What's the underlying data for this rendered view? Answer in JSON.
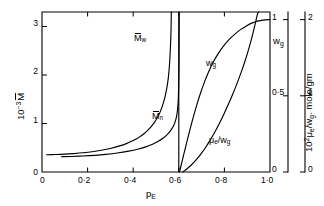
{
  "chart_data": {
    "type": "line",
    "title": "",
    "xlabel": "p_E",
    "xlabel_parts": {
      "base": "p",
      "sub": "E"
    },
    "xlim": [
      0,
      1.0
    ],
    "xticks": [
      0,
      0.2,
      0.4,
      0.6,
      0.8,
      1.0
    ],
    "xticklabels": [
      "0",
      "0·2",
      "0·4",
      "0·6",
      "0·8",
      "1·0"
    ],
    "grid": false,
    "legend": "none (curves labelled inline)",
    "axes": [
      {
        "id": "left",
        "position": "left",
        "label": "10⁻³ M̄",
        "label_parts": {
          "prefix": "10",
          "exponent": "-3",
          "symbol": "M",
          "overline": true
        },
        "lim": [
          0,
          3.3
        ],
        "ticks": [
          0,
          1,
          2,
          3
        ],
        "ticklabels": [
          "0",
          "1",
          "2",
          "3"
        ]
      },
      {
        "id": "right-inner",
        "position": "right-inner",
        "label": "w_g",
        "label_parts": {
          "base": "w",
          "sub": "g"
        },
        "lim": [
          0,
          1.05
        ],
        "ticks": [
          0,
          0.5,
          1
        ],
        "ticklabels": [
          "0",
          "0·5",
          "1"
        ]
      },
      {
        "id": "right-outer",
        "position": "right-outer",
        "label": "10² μ_e/w_g. mole/gm",
        "label_parts": {
          "prefix": "10",
          "exponent": "2",
          "symbol": "μ",
          "sub": "e",
          "divisor": "w",
          "divisor_sub": "g",
          "units": ". mole/gm"
        },
        "lim": [
          0,
          2.1
        ],
        "ticks": [
          0,
          1,
          2
        ],
        "ticklabels": [
          "0",
          "1",
          "2"
        ]
      }
    ],
    "annotations": [
      {
        "name": "gel-point-asymptote",
        "type": "vertical-line",
        "x": 0.6
      }
    ],
    "series": [
      {
        "name": "M̄w",
        "label": "M̄w",
        "label_parts": {
          "symbol": "M",
          "overline": true,
          "sub": "w"
        },
        "axis": "left",
        "color": "#000000",
        "asymptote_x": 0.565,
        "points": [
          [
            0.02,
            0.355
          ],
          [
            0.06,
            0.36
          ],
          [
            0.1,
            0.368
          ],
          [
            0.14,
            0.38
          ],
          [
            0.18,
            0.396
          ],
          [
            0.22,
            0.418
          ],
          [
            0.26,
            0.448
          ],
          [
            0.3,
            0.486
          ],
          [
            0.34,
            0.538
          ],
          [
            0.37,
            0.586
          ],
          [
            0.4,
            0.648
          ],
          [
            0.425,
            0.714
          ],
          [
            0.45,
            0.8
          ],
          [
            0.47,
            0.888
          ],
          [
            0.49,
            1.002
          ],
          [
            0.505,
            1.112
          ],
          [
            0.518,
            1.235
          ],
          [
            0.53,
            1.39
          ],
          [
            0.54,
            1.56
          ],
          [
            0.548,
            1.745
          ],
          [
            0.554,
            1.94
          ],
          [
            0.558,
            2.14
          ],
          [
            0.561,
            2.35
          ],
          [
            0.5635,
            2.59
          ],
          [
            0.5655,
            2.85
          ],
          [
            0.5665,
            3.08
          ],
          [
            0.5672,
            3.3
          ]
        ]
      },
      {
        "name": "M̄n",
        "label": "M̄n",
        "label_parts": {
          "symbol": "M",
          "overline": true,
          "sub": "n"
        },
        "axis": "left",
        "color": "#000000",
        "asymptote_x": 0.6,
        "points": [
          [
            0.085,
            0.315
          ],
          [
            0.13,
            0.32
          ],
          [
            0.18,
            0.33
          ],
          [
            0.23,
            0.344
          ],
          [
            0.28,
            0.364
          ],
          [
            0.33,
            0.392
          ],
          [
            0.38,
            0.43
          ],
          [
            0.42,
            0.47
          ],
          [
            0.455,
            0.518
          ],
          [
            0.485,
            0.572
          ],
          [
            0.51,
            0.632
          ],
          [
            0.532,
            0.7
          ],
          [
            0.55,
            0.775
          ],
          [
            0.564,
            0.855
          ],
          [
            0.576,
            0.945
          ],
          [
            0.584,
            1.035
          ],
          [
            0.59,
            1.14
          ],
          [
            0.5945,
            1.29
          ],
          [
            0.5975,
            1.48
          ],
          [
            0.5992,
            1.72
          ],
          [
            0.6002,
            2.01
          ],
          [
            0.601,
            2.36
          ],
          [
            0.6014,
            2.76
          ],
          [
            0.6017,
            3.3
          ]
        ]
      },
      {
        "name": "wg",
        "label": "wg",
        "label_parts": {
          "base": "w",
          "sub": "g"
        },
        "axis": "right-inner",
        "color": "#000000",
        "points": [
          [
            0.603,
            0.0
          ],
          [
            0.612,
            0.055
          ],
          [
            0.622,
            0.118
          ],
          [
            0.634,
            0.19
          ],
          [
            0.648,
            0.272
          ],
          [
            0.662,
            0.352
          ],
          [
            0.678,
            0.436
          ],
          [
            0.694,
            0.512
          ],
          [
            0.712,
            0.588
          ],
          [
            0.73,
            0.655
          ],
          [
            0.75,
            0.718
          ],
          [
            0.772,
            0.775
          ],
          [
            0.795,
            0.824
          ],
          [
            0.82,
            0.868
          ],
          [
            0.846,
            0.905
          ],
          [
            0.872,
            0.936
          ],
          [
            0.898,
            0.96
          ],
          [
            0.92,
            0.977
          ],
          [
            0.945,
            0.99
          ],
          [
            0.97,
            0.997
          ],
          [
            1.0,
            1.0
          ]
        ]
      },
      {
        "name": "μe/wg",
        "label": "μe/wg",
        "label_parts": {
          "symbol": "μ",
          "sub": "e",
          "divisor": "w",
          "divisor_sub": "g"
        },
        "axis": "right-outer",
        "color": "#000000",
        "points": [
          [
            0.617,
            0.0
          ],
          [
            0.635,
            0.04
          ],
          [
            0.655,
            0.092
          ],
          [
            0.675,
            0.155
          ],
          [
            0.695,
            0.228
          ],
          [
            0.715,
            0.312
          ],
          [
            0.735,
            0.405
          ],
          [
            0.755,
            0.508
          ],
          [
            0.775,
            0.62
          ],
          [
            0.795,
            0.742
          ],
          [
            0.815,
            0.872
          ],
          [
            0.835,
            1.01
          ],
          [
            0.855,
            1.16
          ],
          [
            0.875,
            1.32
          ],
          [
            0.893,
            1.48
          ],
          [
            0.908,
            1.63
          ],
          [
            0.92,
            1.76
          ],
          [
            0.93,
            1.88
          ],
          [
            0.937,
            1.97
          ],
          [
            0.942,
            2.035
          ],
          [
            0.946,
            2.08
          ],
          [
            0.95,
            2.1
          ]
        ]
      }
    ],
    "curve_label_positions": [
      {
        "series": "M̄w",
        "x": 0.43,
        "y_frac": 0.195
      },
      {
        "series": "M̄n",
        "x": 0.505,
        "y_frac": 0.62
      },
      {
        "series": "wg",
        "x": 0.695,
        "y_frac": 0.42
      },
      {
        "series": "μe/wg",
        "x": 0.745,
        "y_frac": 0.79
      }
    ]
  },
  "labels": {
    "x_axis_title_base": "p",
    "x_axis_title_sub": "E",
    "left_axis_prefix": "10",
    "left_axis_exp": "−3",
    "left_axis_symbol": "M",
    "right_inner_axis_base": "w",
    "right_inner_axis_sub": "g",
    "right_outer_prefix": "10",
    "right_outer_exp": "2",
    "right_outer_mu": "μ",
    "right_outer_mu_sub": "e",
    "right_outer_div": "/w",
    "right_outer_div_sub": "g",
    "right_outer_units": ". mole/gm",
    "curve_mw_symbol": "M",
    "curve_mw_sub": "w",
    "curve_mn_symbol": "M",
    "curve_mn_sub": "n",
    "curve_wg_base": "w",
    "curve_wg_sub": "g",
    "curve_mu_symbol": "μ",
    "curve_mu_sub": "e",
    "curve_mu_div": "/w",
    "curve_mu_div_sub": "g",
    "xtick_0": "0",
    "xtick_1": "0·2",
    "xtick_2": "0·4",
    "xtick_3": "0·6",
    "xtick_4": "0·8",
    "xtick_5": "1·0",
    "ytick_l_0": "0",
    "ytick_l_1": "1",
    "ytick_l_2": "2",
    "ytick_l_3": "3",
    "ytick_ri_0": "0",
    "ytick_ri_1": "0·5",
    "ytick_ri_2": "1",
    "ytick_ro_0": "0",
    "ytick_ro_1": "1",
    "ytick_ro_2": "2"
  },
  "colors": {
    "ink": "#000000",
    "background": "#ffffff"
  }
}
